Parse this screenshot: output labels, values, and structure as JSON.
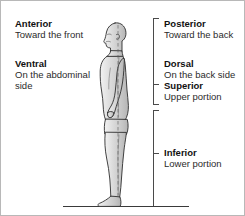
{
  "diagram": {
    "ground_line": "ground-line"
  },
  "labels": {
    "anterior": {
      "term": "Anterior",
      "definition": "Toward the front"
    },
    "ventral": {
      "term": "Ventral",
      "definition": "On the abdominal side"
    },
    "posterior": {
      "term": "Posterior",
      "definition": "Toward the back"
    },
    "dorsal": {
      "term": "Dorsal",
      "definition": "On the back side"
    },
    "superior": {
      "term": "Superior",
      "definition": "Upper portion"
    },
    "inferior": {
      "term": "Inferior",
      "definition": "Lower portion"
    }
  },
  "brackets": [
    {
      "name": "superior-bracket",
      "marks": "Superior"
    },
    {
      "name": "inferior-bracket",
      "marks": "Inferior"
    }
  ],
  "colors": {
    "text": "#1a1a1a",
    "body_fill": "#d8d8d8",
    "body_outline": "#2e2e2e",
    "bracket": "#4a4a4a",
    "frame_border": "#b8b8b8",
    "background": "#ffffff"
  }
}
